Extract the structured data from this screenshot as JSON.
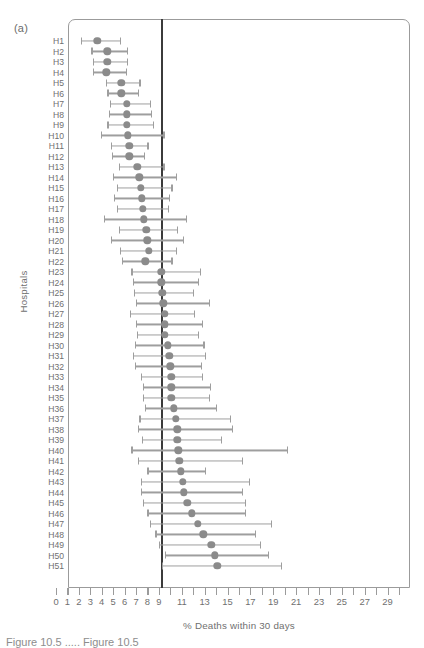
{
  "figure": {
    "panel_label": "(a)",
    "caption_partial": "Figure 10.5  ..... Figure 10.5"
  },
  "chart_data": {
    "type": "scatter",
    "title": "",
    "xlabel": "% Deaths within 30 days",
    "ylabel": "Hospitals",
    "xlim": [
      0,
      30
    ],
    "ylim_categories": 51,
    "grid": false,
    "legend": null,
    "reference_line": 9.15,
    "xticks": [
      0,
      1,
      2,
      3,
      4,
      5,
      6,
      7,
      8,
      9,
      10,
      11,
      12,
      13,
      14,
      15,
      16,
      17,
      18,
      19,
      20,
      21,
      22,
      23,
      24,
      25,
      26,
      27,
      28,
      29,
      30
    ],
    "xticklabels": [
      "0",
      "1",
      "2",
      "3",
      "4",
      "5",
      "6",
      "7",
      "8",
      "9",
      "",
      "11",
      "",
      "13",
      "",
      "15",
      "",
      "17",
      "",
      "19",
      "",
      "21",
      "",
      "23",
      "",
      "25",
      "",
      "27",
      "",
      "29",
      ""
    ],
    "categories": [
      "H1",
      "H2",
      "H3",
      "H4",
      "H5",
      "H6",
      "H7",
      "H8",
      "H9",
      "H10",
      "H11",
      "H12",
      "H13",
      "H14",
      "H15",
      "H16",
      "H17",
      "H18",
      "H19",
      "H20",
      "H21",
      "H22",
      "H23",
      "H24",
      "H25",
      "H26",
      "H27",
      "H28",
      "H29",
      "H30",
      "H31",
      "H32",
      "H33",
      "H34",
      "H35",
      "H36",
      "H37",
      "H38",
      "H39",
      "H40",
      "H41",
      "H42",
      "H43",
      "H44",
      "H45",
      "H46",
      "H47",
      "H48",
      "H49",
      "H50",
      "H51"
    ],
    "point_label": "estimate",
    "interval_label": "95% confidence interval",
    "values": [
      3.6,
      4.5,
      4.5,
      4.4,
      5.7,
      5.7,
      6.2,
      6.2,
      6.2,
      6.3,
      6.4,
      6.4,
      7.1,
      7.3,
      7.4,
      7.5,
      7.6,
      7.7,
      7.9,
      8.0,
      8.1,
      7.8,
      9.2,
      9.2,
      9.3,
      9.4,
      9.5,
      9.5,
      9.5,
      9.8,
      9.9,
      10.0,
      10.1,
      10.1,
      10.1,
      10.3,
      10.5,
      10.6,
      10.6,
      10.7,
      10.8,
      10.9,
      11.1,
      11.2,
      11.5,
      11.9,
      12.4,
      12.9,
      13.6,
      13.9,
      14.1
    ],
    "ci_low": [
      2.2,
      3.1,
      3.2,
      3.2,
      4.4,
      4.5,
      4.7,
      4.6,
      4.5,
      3.9,
      4.8,
      4.9,
      5.5,
      5.0,
      5.3,
      5.1,
      5.3,
      4.2,
      5.5,
      4.8,
      5.6,
      5.8,
      6.6,
      6.7,
      6.8,
      7.0,
      6.5,
      7.0,
      7.1,
      6.9,
      6.7,
      6.9,
      7.4,
      7.6,
      7.6,
      7.8,
      7.3,
      7.2,
      7.5,
      6.6,
      7.2,
      8.0,
      7.4,
      7.4,
      7.6,
      8.0,
      8.2,
      8.7,
      9.0,
      9.5,
      9.3
    ],
    "ci_high": [
      5.6,
      6.2,
      6.2,
      6.1,
      7.3,
      7.2,
      8.2,
      8.3,
      8.5,
      9.4,
      8.0,
      7.7,
      9.4,
      10.5,
      10.1,
      9.9,
      9.8,
      11.4,
      10.6,
      11.1,
      10.5,
      10.1,
      12.6,
      12.4,
      12.0,
      13.4,
      12.1,
      12.8,
      12.4,
      12.9,
      13.0,
      12.7,
      12.8,
      13.5,
      13.4,
      14.0,
      15.2,
      15.4,
      14.4,
      20.2,
      16.3,
      13.0,
      16.9,
      16.3,
      16.5,
      16.5,
      18.8,
      17.4,
      17.8,
      18.5,
      19.7
    ]
  },
  "style": {
    "marker_color": "#8b8b8b",
    "interval_color": "#9e9e9e",
    "reference_line_color": "#3b3b3b",
    "frame_color": "#9b9b9b",
    "text_color": "#6f6f6f"
  }
}
